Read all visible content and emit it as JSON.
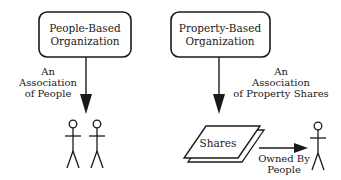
{
  "diagram": {
    "colors": {
      "ink": "#1a1a1a",
      "background": "#ffffff"
    },
    "left": {
      "box": {
        "lines": [
          "People-Based",
          "Organization"
        ]
      },
      "arrow_label": {
        "lines": [
          "An",
          "Association",
          "of People"
        ]
      },
      "figures": [
        "person-icon",
        "person-icon"
      ]
    },
    "right": {
      "box": {
        "lines": [
          "Property-Based",
          "Organization"
        ]
      },
      "arrow_label": {
        "lines": [
          "An",
          "Association",
          "of Property Shares"
        ]
      },
      "shares": {
        "label": "Shares"
      },
      "owned_label": {
        "lines": [
          "Owned By",
          "People"
        ]
      },
      "figures": [
        "person-icon"
      ]
    }
  }
}
